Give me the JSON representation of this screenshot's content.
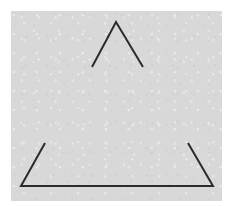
{
  "figure": {
    "name": "incomplete-triangle",
    "background_color": "#ffffff",
    "panel_color": "#d8d8d8",
    "stroke_color": "#2b2b2b",
    "stroke_width": 2,
    "panel": {
      "x": 11,
      "y": 11,
      "width": 211,
      "height": 190
    },
    "vertices": {
      "apex": {
        "x": 105,
        "y": 11
      },
      "bottom_left": {
        "x": 10,
        "y": 175
      },
      "bottom_right": {
        "x": 202,
        "y": 175
      }
    },
    "segments": [
      {
        "id": "apex-segment",
        "label": "Apex chevron",
        "points": "81,56 105,11 132,56"
      },
      {
        "id": "bottom-left-segment",
        "label": "Bottom-left corner",
        "points": "34,132 10,175 105,175"
      },
      {
        "id": "bottom-right-segment",
        "label": "Bottom-right corner",
        "points": "105,175 202,175 177,132"
      }
    ],
    "gaps": [
      {
        "id": "left-side-gap",
        "label": "Gap on left side"
      },
      {
        "id": "right-side-gap",
        "label": "Gap on right side"
      }
    ]
  }
}
